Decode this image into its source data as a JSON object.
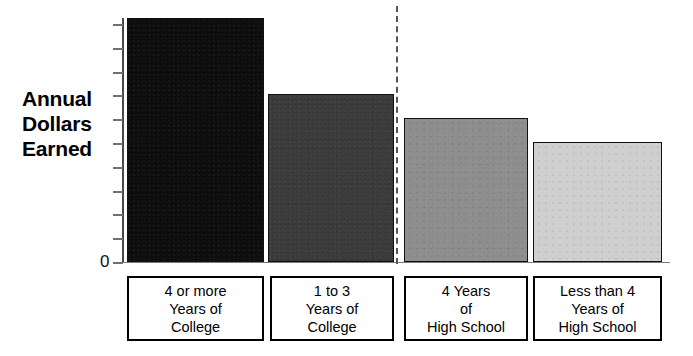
{
  "chart_data": {
    "type": "bar",
    "title": "",
    "ylabel": "Annual Dollars Earned",
    "xlabel": "",
    "grid": false,
    "legend": "none",
    "y_axis": {
      "labeled_ticks": [
        "0"
      ],
      "tick_count": 11,
      "ylim": [
        0,
        100
      ],
      "units": "unlabeled (relative)"
    },
    "categories": [
      "4 or more Years of College",
      "1 to 3 Years of College",
      "4 Years of High School",
      "Less than 4 Years of High School"
    ],
    "values": [
      100,
      69,
      59,
      49
    ],
    "annotations": {
      "group_divider": "dashed vertical line between College group and High School group"
    }
  },
  "axis": {
    "title_lines": [
      "Annual",
      "Dollars",
      "Earned"
    ],
    "zero_label": "0"
  },
  "bars": [
    {
      "name": "bar-college-4-or-more",
      "value": 100,
      "color": "#0d0d0d",
      "left": 5,
      "width": 137
    },
    {
      "name": "bar-college-1-to-3",
      "value": 69,
      "color": "#3a3a3a",
      "left": 146,
      "width": 126
    },
    {
      "name": "bar-high-school-4-years",
      "value": 59,
      "color": "#8d8d8d",
      "left": 282,
      "width": 124
    },
    {
      "name": "bar-high-school-less-than-4",
      "value": 49,
      "color": "#cfcfcf",
      "left": 411,
      "width": 129
    }
  ],
  "categories": [
    {
      "name": "category-label-college-4-or-more",
      "lines": [
        "4 or more",
        "Years of",
        "College"
      ],
      "left": 5,
      "width": 137
    },
    {
      "name": "category-label-college-1-to-3",
      "lines": [
        "1 to 3",
        "Years of",
        "College"
      ],
      "left": 148,
      "width": 124
    },
    {
      "name": "category-label-high-school-4-years",
      "lines": [
        "4 Years",
        "of",
        "High School"
      ],
      "left": 282,
      "width": 124
    },
    {
      "name": "category-label-high-school-less-than-4",
      "lines": [
        "Less than 4",
        "Years of",
        "High School"
      ],
      "left": 411,
      "width": 129
    }
  ]
}
